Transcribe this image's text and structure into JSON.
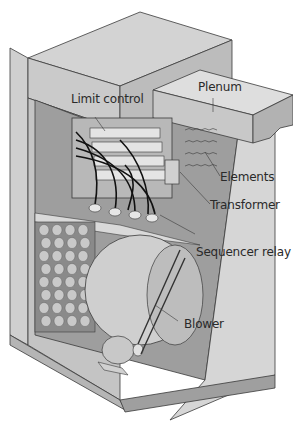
{
  "diagram": {
    "labels": {
      "plenum": "Plenum",
      "limit_control": "Limit control",
      "elements": "Elements",
      "transformer": "Transformer",
      "sequencer_relay": "Sequencer relay",
      "blower": "Blower"
    },
    "colors": {
      "cabinet_light": "#d9d9d9",
      "cabinet_mid": "#bdbdbd",
      "cabinet_dark": "#9a9a9a",
      "interior": "#a8a8a8",
      "outline": "#3a3a3a",
      "wire": "#111111",
      "text": "#2a2a2a"
    }
  }
}
